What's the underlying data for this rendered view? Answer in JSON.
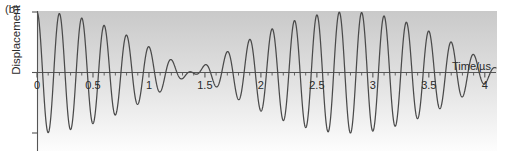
{
  "figure": {
    "panel_label": "(b)",
    "line_color": "#4a4a4a",
    "axis_color": "#555555",
    "bg_top_color": "#c9c9c9",
    "bg_bottom_color": "#fdfdfd"
  },
  "chart_data": {
    "type": "line",
    "title": "",
    "subtitle": "",
    "xlabel": "Time/µs",
    "ylabel": "Displacement",
    "xlim": [
      0,
      4.1
    ],
    "ylim": [
      -1.12,
      1.12
    ],
    "grid": false,
    "legend": null,
    "xticks": [
      0,
      0.5,
      1,
      1.5,
      2,
      2.5,
      3,
      3.5,
      4
    ],
    "xticklabels": [
      "0",
      "0.5",
      "1",
      "1.5",
      "2",
      "2.5",
      "3",
      "3.5",
      "4"
    ],
    "xminor_tick_step": 0.1,
    "yticks": [
      -1,
      0,
      1
    ],
    "yticklabels": [
      "",
      "",
      ""
    ],
    "annotations": [
      {
        "text": "(b)",
        "x": 0.02,
        "y": 1.3,
        "kind": "panel-label"
      }
    ],
    "model": {
      "form": "y = cos(2*pi*f1*t) + cos(2*pi*f2*t), normalised",
      "f1_MHz": 5.18,
      "f2_MHz": 4.82,
      "carrier_MHz": 5.0,
      "beat_MHz": 0.36,
      "beat_period_us": 2.78,
      "node_times_us": [
        0.92,
        3.7
      ]
    },
    "series": [
      {
        "name": "Displacement",
        "color": "#4a4a4a",
        "x": [
          0.0,
          0.05,
          0.1,
          0.15,
          0.2,
          0.25,
          0.3,
          0.35,
          0.4,
          0.45,
          0.5,
          0.55,
          0.6,
          0.65,
          0.7,
          0.75,
          0.8,
          0.85,
          0.9,
          0.95,
          1.0,
          1.05,
          1.1,
          1.15,
          1.2,
          1.25,
          1.3,
          1.35,
          1.4,
          1.45,
          1.5,
          1.55,
          1.6,
          1.65,
          1.7,
          1.75,
          1.8,
          1.85,
          1.9,
          1.95,
          2.0,
          2.05,
          2.1,
          2.15,
          2.2,
          2.25,
          2.3,
          2.35,
          2.4,
          2.45,
          2.5,
          2.55,
          2.6,
          2.65,
          2.7,
          2.75,
          2.8,
          2.85,
          2.9,
          2.95,
          3.0,
          3.05,
          3.1,
          3.15,
          3.2,
          3.25,
          3.3,
          3.35,
          3.4,
          3.45,
          3.5,
          3.55,
          3.6,
          3.65,
          3.7,
          3.75,
          3.8,
          3.85,
          3.9,
          3.95,
          4.0,
          4.05
        ],
        "y": [
          1.0,
          -0.76,
          0.16,
          0.5,
          -0.95,
          0.88,
          -0.33,
          -0.34,
          0.89,
          -0.95,
          0.5,
          0.16,
          -0.75,
          1.0,
          -0.74,
          0.13,
          0.53,
          -0.95,
          0.86,
          -0.29,
          -0.38,
          0.9,
          -0.94,
          0.46,
          0.2,
          -0.78,
          1.0,
          -0.72,
          0.1,
          0.56,
          -0.96,
          0.85,
          -0.25,
          -0.42,
          0.92,
          -0.93,
          0.43,
          0.24,
          -0.8,
          0.99,
          -0.69,
          0.06,
          0.59,
          -0.97,
          0.83,
          -0.21,
          -0.46,
          0.93,
          -0.92,
          0.39,
          0.28,
          -0.82,
          0.99,
          -0.67,
          0.03,
          0.62,
          -0.98,
          0.81,
          -0.17,
          -0.49,
          0.94,
          -0.9,
          0.35,
          0.32,
          -0.84,
          0.98,
          -0.64,
          -0.01,
          0.65,
          -0.98,
          0.79,
          -0.13,
          -0.53,
          0.95,
          -0.89,
          0.31,
          0.36,
          -0.86,
          0.98,
          -0.61,
          -0.05,
          0.68
        ]
      }
    ]
  },
  "axis": {
    "x_axis_name": "zero-line",
    "tick_major_len": 5,
    "tick_minor_len": 3
  }
}
